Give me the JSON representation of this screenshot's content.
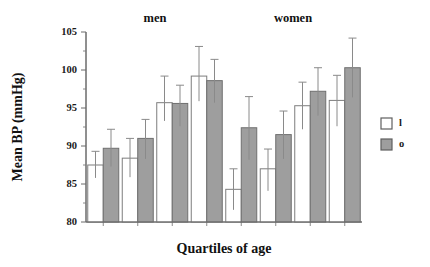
{
  "chart_data": {
    "type": "bar",
    "title": "",
    "xlabel": "Quartiles of age",
    "ylabel": "Mean BP (mmHg)",
    "ylim": [
      80,
      105
    ],
    "ytick_labels": [
      "80",
      "85",
      "90",
      "95",
      "100",
      "105"
    ],
    "ytick_values": [
      80,
      85,
      90,
      95,
      100,
      105
    ],
    "minor_ticks": true,
    "grid": false,
    "legend_position": "right",
    "panel_titles": [
      "men",
      "women"
    ],
    "categories": [
      "Q1",
      "Q2",
      "Q3",
      "Q4"
    ],
    "legend": [
      {
        "key": "l",
        "label": "l",
        "color": "#ffffff"
      },
      {
        "key": "o",
        "label": "o",
        "color": "#9e9e9e"
      }
    ],
    "groups": [
      {
        "name": "men",
        "series": [
          {
            "name": "l",
            "values": [
              87.5,
              88.4,
              95.7,
              99.2
            ],
            "err_low": [
              85.8,
              85.9,
              93.3,
              95.9
            ],
            "err_high": [
              89.3,
              91.0,
              99.2,
              103.1
            ]
          },
          {
            "name": "o",
            "values": [
              89.7,
              91.0,
              95.6,
              98.6
            ],
            "err_low": [
              87.3,
              88.3,
              92.6,
              95.7
            ],
            "err_high": [
              92.2,
              93.5,
              98.0,
              101.4
            ]
          }
        ]
      },
      {
        "name": "women",
        "series": [
          {
            "name": "l",
            "values": [
              84.3,
              87.0,
              95.3,
              96.0
            ],
            "err_low": [
              81.6,
              84.1,
              92.2,
              92.6
            ],
            "err_high": [
              87.0,
              89.6,
              98.4,
              99.3
            ]
          },
          {
            "name": "o",
            "values": [
              92.4,
              91.5,
              97.2,
              100.3
            ],
            "err_low": [
              88.2,
              88.3,
              94.0,
              96.4
            ],
            "err_high": [
              96.5,
              94.6,
              100.3,
              104.2
            ]
          }
        ]
      }
    ]
  },
  "colors": {
    "bar_open": "#ffffff",
    "bar_filled": "#9e9e9e",
    "axis": "#6b6b6b",
    "text": "#111111",
    "background": "#ffffff"
  }
}
